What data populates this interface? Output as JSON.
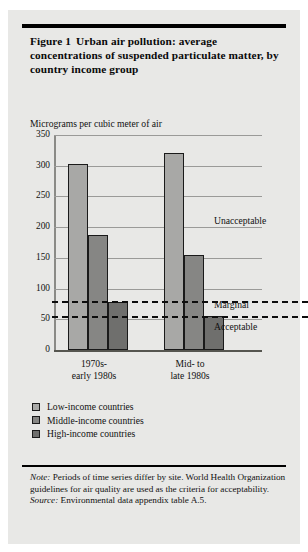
{
  "figure": {
    "label": "Figure 1",
    "title": "Urban air pollution: average concentrations of suspended particulate matter, by country income group",
    "axis_title": "Micrograms per cubic meter of air",
    "note_prefix": "Note:",
    "note_text": " Periods of time series differ by site. World Health Organization guidelines for air quality are used as the criteria for acceptability.",
    "source_prefix": "Source:",
    "source_text": " Environmental data appendix table A.5."
  },
  "chart_data": {
    "type": "bar",
    "title": "Urban air pollution: average concentrations of suspended particulate matter, by country income group",
    "xlabel": "",
    "ylabel": "Micrograms per cubic meter of air",
    "ylim": [
      0,
      350
    ],
    "yticks": [
      0,
      50,
      100,
      150,
      200,
      250,
      300,
      350
    ],
    "ytick_labels": [
      "0",
      "50",
      "100",
      "150",
      "200",
      "250",
      "300",
      "350"
    ],
    "grid": true,
    "legend_position": "below-left",
    "categories": [
      "1970s-\nearly 1980s",
      "Mid- to\nlate 1980s"
    ],
    "category_lines": [
      [
        "1970s-",
        "early 1980s"
      ],
      [
        "Mid- to",
        "late 1980s"
      ]
    ],
    "series": [
      {
        "name": "Low-income countries",
        "values": [
          303,
          320
        ],
        "color": "#a8a8a6"
      },
      {
        "name": "Middle-income countries",
        "values": [
          187,
          155
        ],
        "color": "#868684"
      },
      {
        "name": "High-income countries",
        "values": [
          78,
          55
        ],
        "color": "#6f6f6d"
      }
    ],
    "reference_lines": [
      {
        "label": "Unacceptable",
        "value": null,
        "label_y": 205
      },
      {
        "label": "Marginal",
        "value": 80,
        "style": "dashed",
        "label_y": 67
      },
      {
        "label": "Acceptable",
        "value": 55,
        "style": "dashed",
        "label_y": 35
      }
    ],
    "zone_labels": [
      "Unacceptable",
      "Marginal",
      "Acceptable"
    ]
  },
  "legend": {
    "items": [
      {
        "label": "Low-income countries",
        "color": "#a8a8a6"
      },
      {
        "label": "Middle-income countries",
        "color": "#868684"
      },
      {
        "label": "High-income countries",
        "color": "#6f6f6d"
      }
    ]
  }
}
